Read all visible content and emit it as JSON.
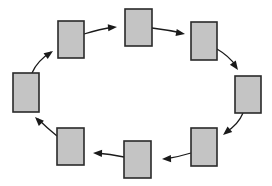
{
  "diagram": {
    "type": "cycle",
    "direction": "clockwise",
    "colors": {
      "node_fill": "#c4c4c4",
      "node_stroke": "#2a2a2a",
      "edge": "#1a1a1a",
      "background": "#ffffff"
    },
    "nodes": [
      {
        "id": "A",
        "x": 58,
        "y": 21,
        "w": 26,
        "h": 37
      },
      {
        "id": "B",
        "x": 125,
        "y": 9,
        "w": 27,
        "h": 37
      },
      {
        "id": "C",
        "x": 191,
        "y": 22,
        "w": 26,
        "h": 38
      },
      {
        "id": "D",
        "x": 235,
        "y": 76,
        "w": 26,
        "h": 37
      },
      {
        "id": "E",
        "x": 191,
        "y": 128,
        "w": 26,
        "h": 38
      },
      {
        "id": "F",
        "x": 124,
        "y": 141,
        "w": 27,
        "h": 37
      },
      {
        "id": "G",
        "x": 57,
        "y": 128,
        "w": 27,
        "h": 37
      },
      {
        "id": "H",
        "x": 13,
        "y": 73,
        "w": 26,
        "h": 39
      }
    ],
    "edges": [
      {
        "from": "H",
        "to": "A",
        "path": "M32,73 Q37,61 51,52",
        "tip": [
          53,
          51
        ],
        "angle": -35
      },
      {
        "from": "A",
        "to": "B",
        "path": "M84,34 Q100,29 114,27",
        "tip": [
          117,
          27
        ],
        "angle": -5
      },
      {
        "from": "B",
        "to": "C",
        "path": "M152,28 Q168,30 182,33",
        "tip": [
          185,
          34
        ],
        "angle": 10
      },
      {
        "from": "C",
        "to": "D",
        "path": "M217,49 Q229,56 236,66",
        "tip": [
          238,
          70
        ],
        "angle": 55
      },
      {
        "from": "D",
        "to": "E",
        "path": "M243,113 Q238,125 226,132",
        "tip": [
          223,
          135
        ],
        "angle": 140
      },
      {
        "from": "E",
        "to": "F",
        "path": "M191,153 Q178,157 165,159",
        "tip": [
          162,
          159
        ],
        "angle": 178
      },
      {
        "from": "F",
        "to": "G",
        "path": "M124,157 Q110,154 96,153",
        "tip": [
          93,
          153
        ],
        "angle": 182
      },
      {
        "from": "G",
        "to": "H",
        "path": "M57,136 Q46,127 38,119",
        "tip": [
          35,
          117
        ],
        "angle": 225
      }
    ]
  }
}
